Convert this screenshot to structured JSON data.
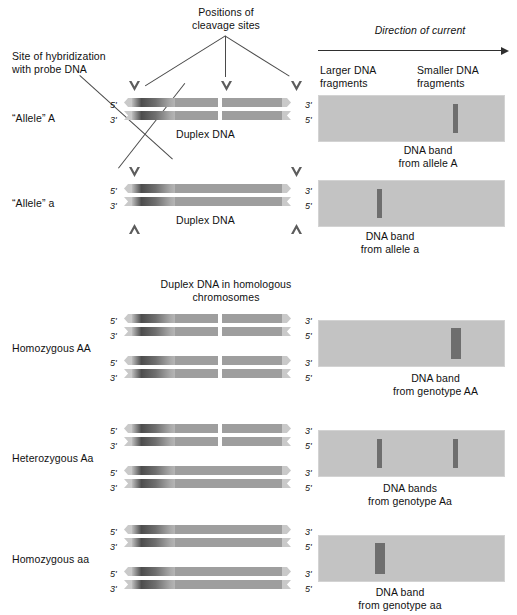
{
  "figure": {
    "title_top": "Positions of\ncleavage sites",
    "probe_label": "Site of hybridization\nwith probe DNA",
    "duplex_caption": "Duplex DNA",
    "homologous_caption": "Duplex DNA in homologous\nchromosomes",
    "current_label": "Direction of current",
    "larger_label": "Larger DNA\nfragments",
    "smaller_label": "Smaller DNA\nfragments",
    "five_prime": "5'",
    "three_prime": "3'"
  },
  "rows": [
    {
      "name": "allele-a-upper",
      "left_label": "“Allele” A",
      "gel_caption": "DNA band\nfrom allele A",
      "duplex_caption": "Duplex DNA",
      "cleavage_sites": 3,
      "bands": [
        {
          "position": "smaller",
          "width": "thin"
        }
      ]
    },
    {
      "name": "allele-a-lower",
      "left_label": "“Allele” a",
      "gel_caption": "DNA band\nfrom allele a",
      "duplex_caption": "Duplex DNA",
      "cleavage_sites": 2,
      "bands": [
        {
          "position": "larger",
          "width": "thin"
        }
      ]
    },
    {
      "name": "homozygous-AA",
      "left_label": "Homozygous AA",
      "gel_caption": "DNA band\nfrom genotype AA",
      "cleavage_sites": 0,
      "bands": [
        {
          "position": "smaller",
          "width": "thick"
        }
      ]
    },
    {
      "name": "heterozygous-Aa",
      "left_label": "Heterozygous Aa",
      "gel_caption": "DNA bands\nfrom genotype Aa",
      "cleavage_sites": 0,
      "bands": [
        {
          "position": "larger",
          "width": "thin"
        },
        {
          "position": "smaller",
          "width": "thin"
        }
      ]
    },
    {
      "name": "homozygous-aa",
      "left_label": "Homozygous aa",
      "gel_caption": "DNA band\nfrom genotype aa",
      "cleavage_sites": 0,
      "bands": [
        {
          "position": "larger",
          "width": "thick"
        }
      ]
    }
  ],
  "colors": {
    "gel_background": "#c3c3c3",
    "band": "#6e6e6e",
    "dna_strand": "#9e9e9e",
    "dna_cap": "#c9c9c9",
    "probe_dark": "#4d4d4d",
    "line": "#4a4a4a",
    "text": "#111111"
  }
}
